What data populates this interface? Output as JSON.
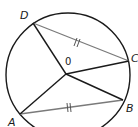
{
  "diagram": {
    "type": "circle-geometry",
    "colors": {
      "circle": "#1a1a1a",
      "radius": "#1a1a1a",
      "chord": "#7a7a7a",
      "background": "#ffffff"
    },
    "circle": {
      "cx": 68,
      "cy": 75,
      "r": 62
    },
    "center": {
      "label": "0",
      "x": 66,
      "y": 74,
      "label_x": 65,
      "label_y": 65
    },
    "points": [
      {
        "id": "D",
        "label": "D",
        "x": 33,
        "y": 23,
        "label_x": 20,
        "label_y": 19
      },
      {
        "id": "C",
        "label": "C",
        "x": 129,
        "y": 61,
        "label_x": 131,
        "label_y": 62
      },
      {
        "id": "B",
        "label": "B",
        "x": 123,
        "y": 100,
        "label_x": 126,
        "label_y": 112
      },
      {
        "id": "A",
        "label": "A",
        "x": 20,
        "y": 114,
        "label_x": 8,
        "label_y": 126
      }
    ],
    "radii": [
      {
        "from": "O",
        "to": "D"
      },
      {
        "from": "O",
        "to": "C"
      },
      {
        "from": "O",
        "to": "B"
      },
      {
        "from": "O",
        "to": "A"
      }
    ],
    "chords": [
      {
        "from": "D",
        "to": "C",
        "tick_marks": "||",
        "note": "equal length"
      },
      {
        "from": "A",
        "to": "B",
        "tick_marks": "||",
        "note": "equal length"
      }
    ]
  }
}
